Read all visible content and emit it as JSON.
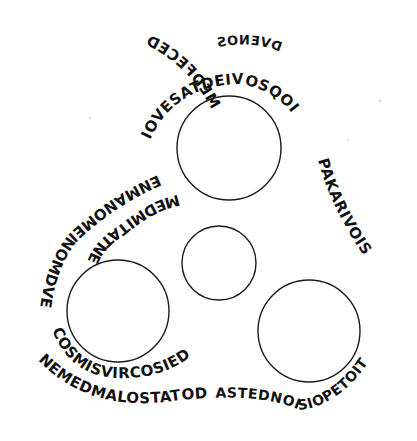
{
  "figure": {
    "background": "#ffffff",
    "ink": "#111111",
    "circles": [
      {
        "id": "top",
        "cx": 229,
        "cy": 148,
        "r": 52
      },
      {
        "id": "center-small",
        "cx": 219,
        "cy": 263,
        "r": 37
      },
      {
        "id": "left",
        "cx": 118,
        "cy": 311,
        "r": 51
      },
      {
        "id": "right",
        "cx": 309,
        "cy": 331,
        "r": 51
      }
    ],
    "inscription": {
      "top_word": "DVENOS",
      "outer_band_top": "MEDFECED",
      "inner_band_top": "IOVESATDEIVOSQOI",
      "left_inner": "MEDMITATNEITEDENDO",
      "left_outer": "ENMANOMEINOMDVENOI",
      "left_around_circle": "COSMISVIRCOSIED",
      "bottom_outer": "NEMEDMALOSTATOD",
      "bottom_right": "ASTEDNOISIOPETOITESIAI",
      "right_band": "PAKARIVOIS"
    }
  }
}
